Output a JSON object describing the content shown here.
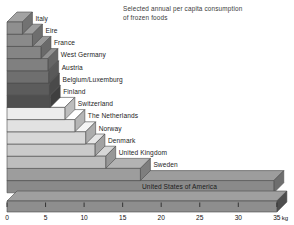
{
  "chart_data": {
    "type": "bar",
    "orientation": "horizontal",
    "title": "Selected annual per capita consumption of frozen foods",
    "title_line1": "Selected annual per capita consumption",
    "title_line2": "of frozen foods",
    "xlabel": "kg",
    "ylabel": "",
    "unit": "kg",
    "xlim": [
      0,
      35
    ],
    "xticks": [
      0,
      5,
      10,
      15,
      20,
      25,
      30,
      35
    ],
    "xtick_labels": [
      "0",
      "5",
      "10",
      "15",
      "20",
      "25",
      "30",
      "35"
    ],
    "grid": false,
    "legend": "none",
    "categories": [
      "Italy",
      "Eire",
      "France",
      "West Germany",
      "Austria",
      "Belgium/Luxemburg",
      "Finland",
      "Switzerland",
      "The Netherlands",
      "Norway",
      "Denmark",
      "United Kingdom",
      "Sweden",
      "United States of America"
    ],
    "values": [
      2.0,
      3.3,
      4.4,
      5.3,
      5.4,
      5.5,
      5.6,
      7.5,
      8.8,
      10.2,
      11.4,
      12.8,
      17.3,
      34.6
    ],
    "bar_colors": [
      "#8f8f8f",
      "#8a8a8a",
      "#858585",
      "#808080",
      "#6f6f6f",
      "#5c5c5c",
      "#4f4f4f",
      "#ececec",
      "#e2e2e2",
      "#d7d7d7",
      "#cacaca",
      "#bdbdbd",
      "#9d9d9d",
      "#8a8a8a"
    ],
    "axis_bar_color": "#8e8e8e",
    "background_color": "#ffffff"
  },
  "axis": {
    "unit_label": "kg"
  }
}
